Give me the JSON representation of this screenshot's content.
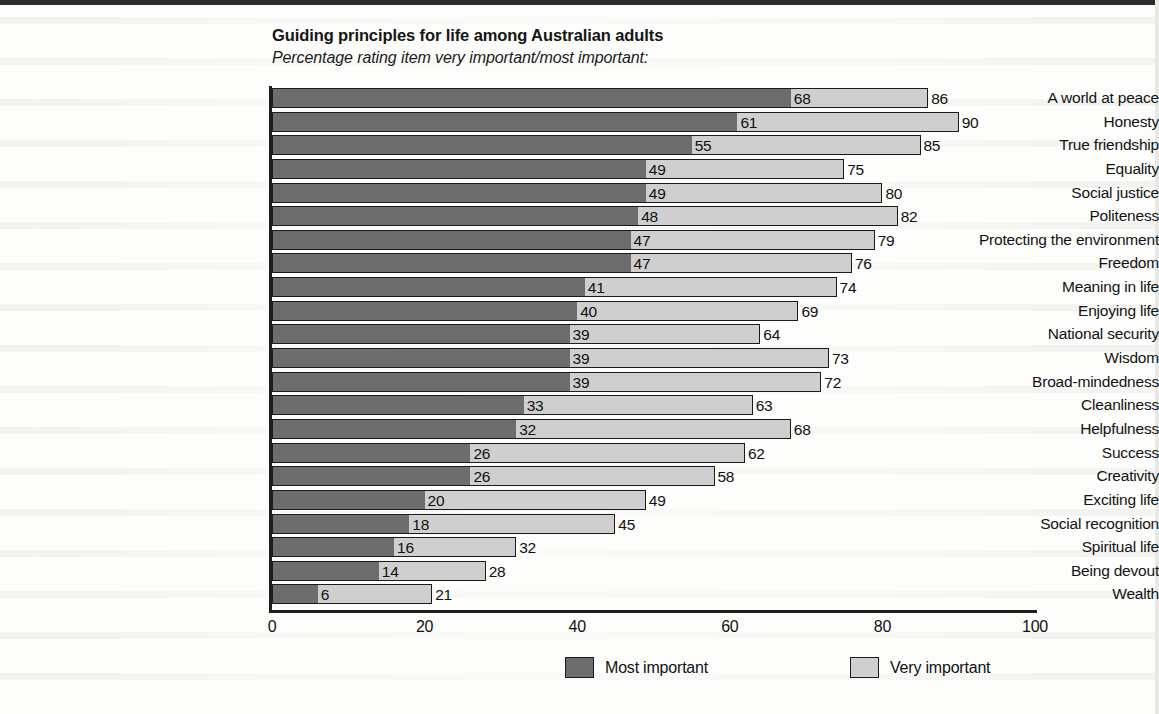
{
  "header": {
    "title": "Guiding principles for life among Australian adults",
    "subtitle": "Percentage rating item very important/most important:"
  },
  "legend": {
    "position": "bottom",
    "items": [
      {
        "label": "Most important",
        "color": "#6d6d6d",
        "swatch_name": "legend-swatch-most-important"
      },
      {
        "label": "Very important",
        "color": "#cfcfcf",
        "swatch_name": "legend-swatch-very-important"
      }
    ]
  },
  "axis": {
    "ticks": [
      "0",
      "20",
      "40",
      "60",
      "80",
      "100"
    ],
    "min": 0,
    "max": 100
  },
  "chart_data": {
    "type": "bar",
    "orientation": "horizontal",
    "stacked": true,
    "title": "Guiding principles for life among Australian adults",
    "subtitle": "Percentage rating item very important/most important:",
    "xlabel": "",
    "ylabel": "",
    "xlim": [
      0,
      100
    ],
    "xticks": [
      0,
      20,
      40,
      60,
      80,
      100
    ],
    "grid": false,
    "legend_position": "bottom",
    "categories": [
      "A world at peace",
      "Honesty",
      "True friendship",
      "Equality",
      "Social justice",
      "Politeness",
      "Protecting the environment",
      "Freedom",
      "Meaning in life",
      "Enjoying life",
      "National security",
      "Wisdom",
      "Broad-mindedness",
      "Cleanliness",
      "Helpfulness",
      "Success",
      "Creativity",
      "Exciting life",
      "Social recognition",
      "Spiritual life",
      "Being devout",
      "Wealth"
    ],
    "series": [
      {
        "name": "Most important",
        "color": "#6d6d6d",
        "values": [
          68,
          61,
          55,
          49,
          49,
          48,
          47,
          47,
          41,
          40,
          39,
          39,
          39,
          33,
          32,
          26,
          26,
          20,
          18,
          16,
          14,
          6
        ]
      },
      {
        "name": "Very important",
        "color": "#cfcfcf",
        "note": "cumulative total shown at end of each bar",
        "totals": [
          86,
          90,
          85,
          75,
          80,
          82,
          79,
          76,
          74,
          69,
          64,
          73,
          72,
          63,
          68,
          62,
          58,
          49,
          45,
          32,
          28,
          21
        ]
      }
    ],
    "rows": [
      {
        "category": "A world at peace",
        "most": 68,
        "total": 86
      },
      {
        "category": "Honesty",
        "most": 61,
        "total": 90
      },
      {
        "category": "True friendship",
        "most": 55,
        "total": 85
      },
      {
        "category": "Equality",
        "most": 49,
        "total": 75
      },
      {
        "category": "Social justice",
        "most": 49,
        "total": 80
      },
      {
        "category": "Politeness",
        "most": 48,
        "total": 82
      },
      {
        "category": "Protecting the environment",
        "most": 47,
        "total": 79
      },
      {
        "category": "Freedom",
        "most": 47,
        "total": 76
      },
      {
        "category": "Meaning in life",
        "most": 41,
        "total": 74
      },
      {
        "category": "Enjoying life",
        "most": 40,
        "total": 69
      },
      {
        "category": "National security",
        "most": 39,
        "total": 64
      },
      {
        "category": "Wisdom",
        "most": 39,
        "total": 73
      },
      {
        "category": "Broad-mindedness",
        "most": 39,
        "total": 72
      },
      {
        "category": "Cleanliness",
        "most": 33,
        "total": 63
      },
      {
        "category": "Helpfulness",
        "most": 32,
        "total": 68
      },
      {
        "category": "Success",
        "most": 26,
        "total": 62
      },
      {
        "category": "Creativity",
        "most": 26,
        "total": 58
      },
      {
        "category": "Exciting life",
        "most": 20,
        "total": 49
      },
      {
        "category": "Social recognition",
        "most": 18,
        "total": 45
      },
      {
        "category": "Spiritual life",
        "most": 16,
        "total": 32
      },
      {
        "category": "Being devout",
        "most": 14,
        "total": 28
      },
      {
        "category": "Wealth",
        "most": 6,
        "total": 21
      }
    ]
  }
}
